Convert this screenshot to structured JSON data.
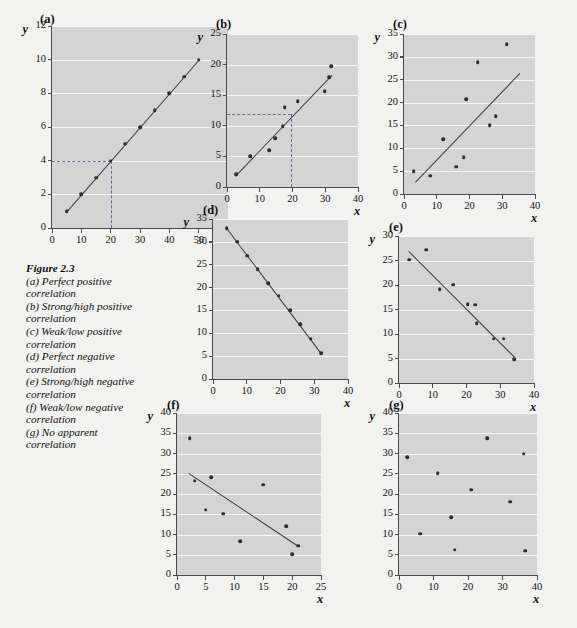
{
  "figure": {
    "number": "Figure 2.3",
    "caption_lines": [
      "(a) Perfect positive",
      "correlation",
      "(b) Strong/high positive",
      "correlation",
      "(c) Weak/low positive",
      "correlation",
      "(d) Perfect negative",
      "correlation",
      "(e) Strong/high negative",
      "correlation",
      "(f) Weak/low negative",
      "correlation",
      "(g) No apparent",
      "correlation"
    ],
    "axis_x_label": "x",
    "axis_y_label": "y",
    "colors": {
      "page_background": "#f2f2f0",
      "plot_background": "#d4d4d4",
      "gridline": "#f7f7f7",
      "marker": "#2e2e2e",
      "trendline": "#3d3d3d",
      "dashed_guide": "#6a6a93",
      "axis": "#4a4a4a"
    }
  },
  "chart_data": [
    {
      "id": "a",
      "type": "scatter",
      "title": "(a)",
      "description": "Perfect positive correlation",
      "xlabel": "x",
      "ylabel": "y",
      "xlim": [
        0,
        60
      ],
      "ylim": [
        0,
        12
      ],
      "xticks": [
        0,
        10,
        20,
        30,
        40,
        50,
        60
      ],
      "yticks": [
        0,
        2,
        4,
        6,
        8,
        10,
        12
      ],
      "grid": true,
      "has_trendline": true,
      "trendline": {
        "x1": 5,
        "y1": 1,
        "x2": 50,
        "y2": 10
      },
      "guides": [
        {
          "type": "horizontal",
          "y": 4,
          "x_from": 0,
          "x_to": 20
        },
        {
          "type": "vertical",
          "x": 20,
          "y_from": 0,
          "y_to": 4
        }
      ],
      "points": [
        {
          "x": 5,
          "y": 1
        },
        {
          "x": 10,
          "y": 2
        },
        {
          "x": 15,
          "y": 3
        },
        {
          "x": 20,
          "y": 4
        },
        {
          "x": 25,
          "y": 5
        },
        {
          "x": 30,
          "y": 6
        },
        {
          "x": 35,
          "y": 7
        },
        {
          "x": 40,
          "y": 8
        },
        {
          "x": 45,
          "y": 9
        },
        {
          "x": 50,
          "y": 10
        }
      ]
    },
    {
      "id": "b",
      "type": "scatter",
      "title": "(b)",
      "description": "Strong/high positive correlation",
      "xlabel": "x",
      "ylabel": "y",
      "xlim": [
        0,
        40
      ],
      "ylim": [
        0,
        25
      ],
      "xticks": [
        0,
        10,
        20,
        30,
        40
      ],
      "yticks": [
        0,
        5,
        10,
        15,
        20,
        25
      ],
      "grid": true,
      "has_trendline": true,
      "trendline": {
        "x1": 2.5,
        "y1": 1.8,
        "x2": 32,
        "y2": 18.3
      },
      "guides": [
        {
          "type": "horizontal",
          "y": 12,
          "x_from": 0,
          "x_to": 19.5
        },
        {
          "type": "vertical",
          "x": 19.5,
          "y_from": 0,
          "y_to": 12
        }
      ],
      "points": [
        {
          "x": 2.8,
          "y": 2.1
        },
        {
          "x": 7.0,
          "y": 5.0
        },
        {
          "x": 12.8,
          "y": 6.0
        },
        {
          "x": 14.8,
          "y": 8.0
        },
        {
          "x": 17.0,
          "y": 9.9
        },
        {
          "x": 17.6,
          "y": 13.0
        },
        {
          "x": 21.6,
          "y": 14.0
        },
        {
          "x": 29.8,
          "y": 15.7
        },
        {
          "x": 31.2,
          "y": 17.9
        },
        {
          "x": 31.8,
          "y": 19.7
        }
      ]
    },
    {
      "id": "c",
      "type": "scatter",
      "title": "(c)",
      "description": "Weak/low positive correlation",
      "xlabel": "x",
      "ylabel": "y",
      "xlim": [
        0,
        40
      ],
      "ylim": [
        0,
        35
      ],
      "xticks": [
        0,
        10,
        20,
        30,
        40
      ],
      "yticks": [
        0,
        5,
        10,
        15,
        20,
        25,
        30,
        35
      ],
      "grid": true,
      "has_trendline": true,
      "trendline": {
        "x1": 3.5,
        "y1": 2.6,
        "x2": 35.5,
        "y2": 26.5
      },
      "guides": [],
      "points": [
        {
          "x": 3.0,
          "y": 5.0
        },
        {
          "x": 8.0,
          "y": 4.0
        },
        {
          "x": 12.0,
          "y": 12.0
        },
        {
          "x": 16.0,
          "y": 6.0
        },
        {
          "x": 18.2,
          "y": 8.0
        },
        {
          "x": 19.0,
          "y": 20.8
        },
        {
          "x": 22.5,
          "y": 28.8
        },
        {
          "x": 26.2,
          "y": 15.0
        },
        {
          "x": 28.0,
          "y": 17.0
        },
        {
          "x": 31.4,
          "y": 32.8
        }
      ]
    },
    {
      "id": "d",
      "type": "scatter",
      "title": "(d)",
      "description": "Perfect negative correlation",
      "xlabel": "x",
      "ylabel": "y",
      "xlim": [
        0,
        40
      ],
      "ylim": [
        0,
        35
      ],
      "xticks": [
        0,
        10,
        20,
        30,
        40
      ],
      "yticks": [
        0,
        5,
        10,
        15,
        20,
        25,
        30,
        35
      ],
      "grid": true,
      "has_trendline": true,
      "trendline": {
        "x1": 4,
        "y1": 33,
        "x2": 32,
        "y2": 5.6
      },
      "guides": [],
      "points": [
        {
          "x": 4.0,
          "y": 33.0
        },
        {
          "x": 7.1,
          "y": 30.0
        },
        {
          "x": 10.2,
          "y": 27.0
        },
        {
          "x": 13.3,
          "y": 24.0
        },
        {
          "x": 16.4,
          "y": 21.0
        },
        {
          "x": 19.5,
          "y": 18.2
        },
        {
          "x": 22.8,
          "y": 15.0
        },
        {
          "x": 25.9,
          "y": 12.0
        },
        {
          "x": 29.0,
          "y": 8.8
        },
        {
          "x": 32.0,
          "y": 5.6
        }
      ]
    },
    {
      "id": "e",
      "type": "scatter",
      "title": "(e)",
      "description": "Strong/high negative correlation",
      "xlabel": "x",
      "ylabel": "y",
      "xlim": [
        0,
        40
      ],
      "ylim": [
        0,
        30
      ],
      "xticks": [
        0,
        10,
        20,
        30,
        40
      ],
      "yticks": [
        0,
        5,
        10,
        15,
        20,
        25,
        30
      ],
      "grid": true,
      "has_trendline": true,
      "trendline": {
        "x1": 3.0,
        "y1": 27.0,
        "x2": 34.5,
        "y2": 5.3
      },
      "guides": [],
      "points": [
        {
          "x": 3.0,
          "y": 25.2
        },
        {
          "x": 8.0,
          "y": 27.2
        },
        {
          "x": 12.0,
          "y": 19.2
        },
        {
          "x": 16.0,
          "y": 20.1
        },
        {
          "x": 20.3,
          "y": 16.1
        },
        {
          "x": 22.5,
          "y": 16.0
        },
        {
          "x": 23.0,
          "y": 12.2
        },
        {
          "x": 28.0,
          "y": 9.0
        },
        {
          "x": 31.0,
          "y": 9.0
        },
        {
          "x": 34.2,
          "y": 4.8
        }
      ]
    },
    {
      "id": "f",
      "type": "scatter",
      "title": "(f)",
      "description": "Weak/low negative correlation",
      "xlabel": "x",
      "ylabel": "y",
      "xlim": [
        0,
        25
      ],
      "ylim": [
        0,
        40
      ],
      "xticks": [
        0,
        5,
        10,
        15,
        20,
        25
      ],
      "yticks": [
        0,
        5,
        10,
        15,
        20,
        25,
        30,
        35,
        40
      ],
      "grid": true,
      "has_trendline": true,
      "trendline": {
        "x1": 2.0,
        "y1": 25.3,
        "x2": 21.0,
        "y2": 7.3
      },
      "guides": [],
      "points": [
        {
          "x": 2.2,
          "y": 33.8
        },
        {
          "x": 3.1,
          "y": 23.3
        },
        {
          "x": 5.9,
          "y": 24.2
        },
        {
          "x": 5.0,
          "y": 16.1
        },
        {
          "x": 8.0,
          "y": 15.1
        },
        {
          "x": 11.0,
          "y": 8.3
        },
        {
          "x": 15.0,
          "y": 22.3
        },
        {
          "x": 19.0,
          "y": 12.1
        },
        {
          "x": 20.0,
          "y": 5.1
        },
        {
          "x": 21.0,
          "y": 7.2
        }
      ]
    },
    {
      "id": "g",
      "type": "scatter",
      "title": "(g)",
      "description": "No apparent correlation",
      "xlabel": "x",
      "ylabel": "y",
      "xlim": [
        0,
        40
      ],
      "ylim": [
        0,
        40
      ],
      "xticks": [
        0,
        10,
        20,
        30,
        40
      ],
      "yticks": [
        0,
        5,
        10,
        15,
        20,
        25,
        30,
        35,
        40
      ],
      "grid": true,
      "has_trendline": false,
      "trendline": null,
      "guides": [],
      "points": [
        {
          "x": 2.3,
          "y": 29.1
        },
        {
          "x": 6.2,
          "y": 10.2
        },
        {
          "x": 11.2,
          "y": 25.1
        },
        {
          "x": 15.2,
          "y": 14.2
        },
        {
          "x": 16.1,
          "y": 6.2
        },
        {
          "x": 21.0,
          "y": 21.1
        },
        {
          "x": 25.6,
          "y": 33.8
        },
        {
          "x": 32.2,
          "y": 18.1
        },
        {
          "x": 36.2,
          "y": 30.0
        },
        {
          "x": 36.5,
          "y": 6.0
        }
      ]
    }
  ],
  "panel_geometry": [
    {
      "id": "a",
      "left": 52,
      "top": 26,
      "width": 176,
      "height": 202,
      "letter_left": 40,
      "letter_top": 12
    },
    {
      "id": "b",
      "left": 227,
      "top": 34,
      "width": 131,
      "height": 153,
      "letter_left": 216,
      "letter_top": 17
    },
    {
      "id": "c",
      "left": 404,
      "top": 34,
      "width": 131,
      "height": 160,
      "letter_left": 393,
      "letter_top": 17
    },
    {
      "id": "d",
      "left": 213,
      "top": 219,
      "width": 135,
      "height": 160,
      "letter_left": 203,
      "letter_top": 203
    },
    {
      "id": "e",
      "left": 399,
      "top": 236,
      "width": 135,
      "height": 147,
      "letter_left": 389,
      "letter_top": 220
    },
    {
      "id": "f",
      "left": 177,
      "top": 413,
      "width": 144,
      "height": 162,
      "letter_left": 167,
      "letter_top": 398
    },
    {
      "id": "g",
      "left": 399,
      "top": 413,
      "width": 138,
      "height": 162,
      "letter_left": 389,
      "letter_top": 398
    }
  ]
}
